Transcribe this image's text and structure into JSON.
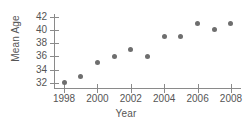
{
  "chart_data": {
    "type": "scatter",
    "title": "",
    "xlabel": "Year",
    "ylabel": "Mean Age",
    "xlim": [
      1997.4,
      2008.6
    ],
    "ylim": [
      31.2,
      42.4
    ],
    "grid": false,
    "legend": null,
    "marker_color": "#6e6e6e",
    "axis_color": "#8a8a8a",
    "text_color": "#555555",
    "background": "#ffffff",
    "x": [
      1998,
      1999,
      2000,
      2001,
      2002,
      2003,
      2004,
      2005,
      2006,
      2007,
      2008
    ],
    "values": [
      32,
      33,
      35,
      36,
      37,
      36,
      39,
      39,
      41,
      40,
      41
    ],
    "points": [
      {
        "x": 1998,
        "y": 32
      },
      {
        "x": 1999,
        "y": 33
      },
      {
        "x": 2000,
        "y": 35
      },
      {
        "x": 2001,
        "y": 36
      },
      {
        "x": 2002,
        "y": 37
      },
      {
        "x": 2003,
        "y": 36
      },
      {
        "x": 2004,
        "y": 39
      },
      {
        "x": 2005,
        "y": 39
      },
      {
        "x": 2006,
        "y": 41
      },
      {
        "x": 2007,
        "y": 40
      },
      {
        "x": 2008,
        "y": 41
      }
    ],
    "xticks": [
      1998,
      2000,
      2002,
      2004,
      2006,
      2008
    ],
    "xticklabels": [
      "1998",
      "2000",
      "2002",
      "2004",
      "2006",
      "2008"
    ],
    "yticks": [
      32,
      34,
      36,
      38,
      40,
      42
    ],
    "yticklabels": [
      "32",
      "34",
      "36",
      "38",
      "40",
      "42"
    ]
  }
}
